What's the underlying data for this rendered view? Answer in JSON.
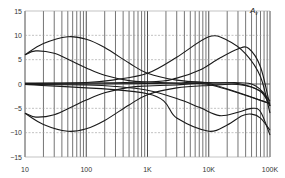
{
  "chart_data": {
    "type": "line",
    "title": "",
    "xlabel": "",
    "ylabel": "A_v",
    "annotation": {
      "text": "A",
      "subscript": "v"
    },
    "x_scale": "log",
    "xlim": [
      10,
      100000
    ],
    "ylim": [
      -15,
      15
    ],
    "x_ticks": [
      {
        "value": 10,
        "label": "10"
      },
      {
        "value": 100,
        "label": "100"
      },
      {
        "value": 1000,
        "label": "1K"
      },
      {
        "value": 10000,
        "label": "10K"
      },
      {
        "value": 100000,
        "label": "100K"
      }
    ],
    "y_ticks": [
      {
        "value": 15,
        "label": "15"
      },
      {
        "value": 10,
        "label": "10"
      },
      {
        "value": 5,
        "label": "5"
      },
      {
        "value": 0,
        "label": "0"
      },
      {
        "value": -5,
        "label": "−5"
      },
      {
        "value": -10,
        "label": "−10"
      },
      {
        "value": -15,
        "label": "−15"
      }
    ],
    "grid": {
      "x_minor_log": true,
      "y_major_dashed": true
    },
    "legend": null,
    "series": [
      {
        "name": "bass-boost-max",
        "x": [
          10,
          20,
          50,
          100,
          200,
          500,
          1000,
          3000,
          10000,
          30000,
          70000,
          100000
        ],
        "values": [
          6.0,
          8.3,
          9.7,
          9.2,
          7.5,
          4.3,
          2.2,
          0.8,
          0.3,
          0.1,
          -1.5,
          -4.5
        ]
      },
      {
        "name": "bass-boost-mid",
        "x": [
          10,
          15,
          30,
          60,
          100,
          200,
          500,
          1000,
          3000,
          10000,
          100000
        ],
        "values": [
          6.0,
          6.8,
          6.3,
          4.6,
          3.3,
          1.8,
          0.7,
          0.4,
          0.2,
          0.1,
          -4.0
        ]
      },
      {
        "name": "flat",
        "x": [
          10,
          100,
          1000,
          10000,
          50000,
          100000
        ],
        "values": [
          0,
          0,
          0.1,
          0.2,
          0,
          -3.5
        ]
      },
      {
        "name": "bass-cut-mid",
        "x": [
          10,
          15,
          30,
          60,
          100,
          200,
          500,
          1000,
          3000,
          10000,
          100000
        ],
        "values": [
          -6.0,
          -6.8,
          -6.3,
          -4.6,
          -3.3,
          -1.8,
          -0.7,
          -0.4,
          -0.2,
          -0.1,
          -4.0
        ]
      },
      {
        "name": "bass-cut-max",
        "x": [
          10,
          20,
          50,
          100,
          200,
          500,
          1000,
          3000,
          10000,
          30000,
          70000,
          100000
        ],
        "values": [
          -6.0,
          -8.3,
          -9.7,
          -9.2,
          -7.5,
          -4.3,
          -2.2,
          -0.8,
          -0.3,
          -0.1,
          -1.5,
          -4.5
        ]
      },
      {
        "name": "treble-boost-max",
        "x": [
          10,
          100,
          300,
          1000,
          3000,
          10000,
          20000,
          40000,
          70000,
          100000
        ],
        "values": [
          0.2,
          0.3,
          0.9,
          2.2,
          5.5,
          9.7,
          9.0,
          6.2,
          1.5,
          -6.0
        ]
      },
      {
        "name": "treble-boost-mid",
        "x": [
          10,
          1000,
          3000,
          7000,
          15000,
          30000,
          45000,
          70000,
          100000
        ],
        "values": [
          0.1,
          0.4,
          1.2,
          2.8,
          5.3,
          7.2,
          7.3,
          3.5,
          -4.5
        ]
      },
      {
        "name": "treble-cut-mid",
        "x": [
          10,
          100,
          300,
          1000,
          3000,
          7000,
          15000,
          30000,
          50000,
          70000,
          100000
        ],
        "values": [
          -0.1,
          -0.2,
          -0.5,
          -1.3,
          -3.0,
          -4.8,
          -6.5,
          -5.8,
          -5.0,
          -5.7,
          -10.5
        ]
      },
      {
        "name": "treble-cut-max",
        "x": [
          10,
          1000,
          3000,
          10000,
          20000,
          35000,
          50000,
          70000,
          100000
        ],
        "values": [
          -0.1,
          -2.0,
          -7.0,
          -9.7,
          -8.4,
          -6.5,
          -6.2,
          -7.0,
          -9.5
        ]
      }
    ]
  },
  "colors": {
    "curve": "#1a1a1a",
    "minor_grid": "#3a3a3a",
    "major_grid_h": "#9a9a9a",
    "frame": "#444444"
  }
}
